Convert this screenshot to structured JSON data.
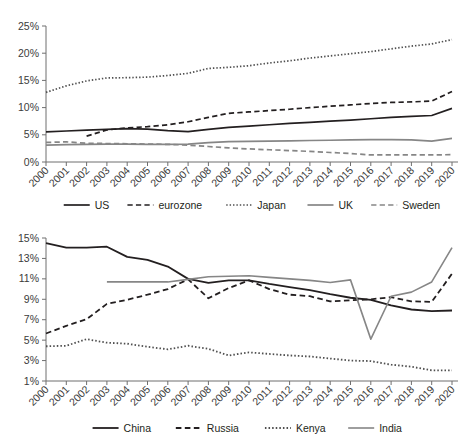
{
  "figure": {
    "background": "#ffffff",
    "panel_count": 2
  },
  "styles": {
    "dark": "#231f20",
    "gray": "#868686",
    "axis": "#6f6f6f",
    "text": "#3b3b3b"
  },
  "chart_data": [
    {
      "id": "advanced-economies",
      "type": "line",
      "title": "",
      "subtitle": "",
      "xlabel": "",
      "ylabel": "",
      "grid": false,
      "legend_position": "bottom",
      "x": [
        2000,
        2001,
        2002,
        2003,
        2004,
        2005,
        2006,
        2007,
        2008,
        2009,
        2010,
        2011,
        2012,
        2013,
        2014,
        2015,
        2016,
        2017,
        2018,
        2019,
        2020
      ],
      "categories": [
        "2000",
        "2001",
        "2002",
        "2003",
        "2004",
        "2005",
        "2006",
        "2007",
        "2008",
        "2009",
        "2010",
        "2011",
        "2012",
        "2013",
        "2014",
        "2015",
        "2016",
        "2017",
        "2018",
        "2019",
        "2020"
      ],
      "ylim": [
        0,
        25
      ],
      "yticks": [
        0,
        5,
        10,
        15,
        20,
        25
      ],
      "ytick_labels": [
        "0%",
        "5%",
        "10%",
        "15%",
        "20%",
        "25%"
      ],
      "series": [
        {
          "name": "US",
          "style": "solid",
          "color": "#231f20",
          "width": 1.7,
          "values": [
            5.55,
            5.7,
            5.85,
            6.0,
            6.15,
            6.05,
            5.75,
            5.6,
            6.0,
            6.35,
            6.6,
            6.85,
            7.1,
            7.3,
            7.5,
            7.7,
            7.95,
            8.2,
            8.4,
            8.55,
            9.85
          ]
        },
        {
          "name": "eurozone",
          "style": "dashed",
          "color": "#231f20",
          "width": 1.7,
          "values": [
            null,
            null,
            4.75,
            5.9,
            6.25,
            6.5,
            6.85,
            7.4,
            8.2,
            8.95,
            9.2,
            9.45,
            9.7,
            10.0,
            10.25,
            10.5,
            10.75,
            10.95,
            11.05,
            11.2,
            12.95
          ]
        },
        {
          "name": "Japan",
          "style": "dotted",
          "color": "#4f4f4f",
          "width": 1.7,
          "values": [
            12.8,
            14.0,
            14.9,
            15.45,
            15.5,
            15.6,
            15.9,
            16.3,
            17.2,
            17.4,
            17.7,
            18.2,
            18.6,
            19.1,
            19.5,
            19.9,
            20.3,
            20.8,
            21.3,
            21.7,
            22.5
          ]
        },
        {
          "name": "UK",
          "style": "solid",
          "color": "#868686",
          "width": 1.7,
          "values": [
            3.1,
            3.2,
            3.25,
            3.3,
            3.3,
            3.25,
            3.25,
            3.3,
            3.55,
            3.75,
            3.8,
            3.85,
            3.9,
            3.95,
            4.0,
            4.05,
            4.1,
            4.1,
            4.05,
            3.85,
            4.35
          ]
        },
        {
          "name": "Sweden",
          "style": "dashed",
          "color": "#868686",
          "width": 1.7,
          "values": [
            3.6,
            3.7,
            3.45,
            3.4,
            3.35,
            3.3,
            3.25,
            3.1,
            2.85,
            2.6,
            2.4,
            2.25,
            2.1,
            1.95,
            1.75,
            1.55,
            1.3,
            1.3,
            1.3,
            1.3,
            1.35
          ]
        }
      ]
    },
    {
      "id": "emerging-economies",
      "type": "line",
      "title": "",
      "subtitle": "",
      "xlabel": "",
      "ylabel": "",
      "grid": false,
      "legend_position": "bottom",
      "x": [
        2000,
        2001,
        2002,
        2003,
        2004,
        2005,
        2006,
        2007,
        2008,
        2009,
        2010,
        2011,
        2012,
        2013,
        2014,
        2015,
        2016,
        2017,
        2018,
        2019,
        2020
      ],
      "categories": [
        "2000",
        "2001",
        "2002",
        "2003",
        "2004",
        "2005",
        "2006",
        "2007",
        "2008",
        "2009",
        "2010",
        "2011",
        "2012",
        "2013",
        "2014",
        "2015",
        "2016",
        "2017",
        "2018",
        "2019",
        "2020"
      ],
      "ylim": [
        1,
        15
      ],
      "yticks": [
        1,
        3,
        5,
        7,
        9,
        11,
        13,
        15
      ],
      "ytick_labels": [
        "1%",
        "3%",
        "5%",
        "7%",
        "9%",
        "11%",
        "13%",
        "15%"
      ],
      "series": [
        {
          "name": "China",
          "style": "solid",
          "color": "#231f20",
          "width": 1.8,
          "values": [
            14.5,
            14.05,
            14.05,
            14.15,
            13.15,
            12.85,
            12.2,
            11.0,
            10.6,
            10.85,
            10.85,
            10.5,
            10.2,
            9.9,
            9.5,
            9.15,
            8.95,
            8.4,
            8.0,
            7.85,
            7.9
          ]
        },
        {
          "name": "Russia",
          "style": "dashed",
          "color": "#231f20",
          "width": 1.8,
          "values": [
            5.65,
            6.4,
            7.05,
            8.55,
            8.95,
            9.45,
            10.0,
            10.95,
            9.1,
            10.1,
            10.85,
            10.0,
            9.45,
            9.3,
            8.8,
            8.9,
            9.0,
            9.2,
            8.8,
            8.75,
            11.5
          ]
        },
        {
          "name": "Kenya",
          "style": "dotted",
          "color": "#4f4f4f",
          "width": 1.8,
          "values": [
            4.4,
            4.45,
            5.1,
            4.75,
            4.65,
            4.35,
            4.1,
            4.45,
            4.15,
            3.5,
            3.8,
            3.65,
            3.5,
            3.4,
            3.2,
            3.0,
            2.95,
            2.6,
            2.4,
            2.05,
            2.05
          ]
        },
        {
          "name": "India",
          "style": "solid",
          "color": "#868686",
          "width": 1.6,
          "values": [
            null,
            null,
            null,
            10.7,
            10.7,
            10.7,
            10.7,
            10.95,
            11.2,
            11.25,
            11.3,
            11.15,
            11.0,
            10.85,
            10.65,
            10.9,
            5.1,
            9.3,
            9.7,
            10.7,
            14.05
          ]
        }
      ]
    }
  ]
}
